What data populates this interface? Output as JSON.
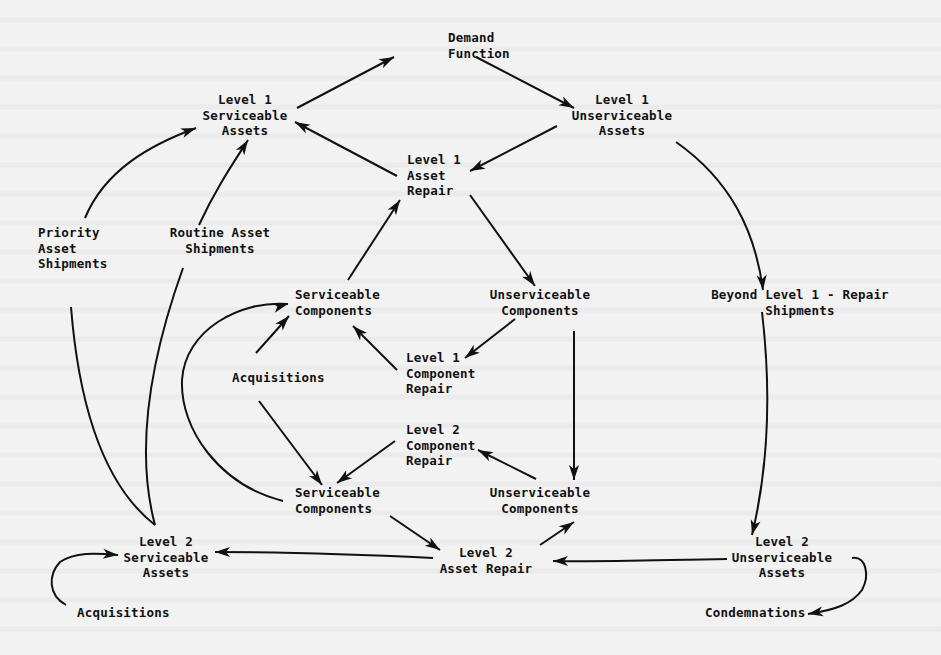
{
  "figure": {
    "type": "flow-diagram"
  },
  "nodes": [
    {
      "id": "demand_function",
      "lines": [
        "Demand",
        "Function"
      ],
      "x": 448,
      "y": 42,
      "anchor": "start"
    },
    {
      "id": "l1_serviceable_assets",
      "lines": [
        "Level 1",
        "Serviceable",
        "Assets"
      ],
      "x": 245,
      "y": 104,
      "anchor": "middle"
    },
    {
      "id": "l1_unserviceable_assets",
      "lines": [
        "Level 1",
        "Unserviceable",
        "Assets"
      ],
      "x": 622,
      "y": 104,
      "anchor": "middle"
    },
    {
      "id": "l1_asset_repair",
      "lines": [
        "Level 1",
        "Asset",
        "Repair"
      ],
      "x": 407,
      "y": 164,
      "anchor": "start"
    },
    {
      "id": "priority_asset_shipments",
      "lines": [
        "Priority",
        "Asset",
        "Shipments"
      ],
      "x": 38,
      "y": 237,
      "anchor": "start"
    },
    {
      "id": "routine_asset_shipments",
      "lines": [
        "Routine Asset",
        "Shipments"
      ],
      "x": 220,
      "y": 237,
      "anchor": "middle"
    },
    {
      "id": "serviceable_components_top",
      "lines": [
        "Serviceable",
        "Components"
      ],
      "x": 295,
      "y": 299,
      "anchor": "start"
    },
    {
      "id": "unserviceable_components_top",
      "lines": [
        "Unserviceable",
        "Components"
      ],
      "x": 540,
      "y": 299,
      "anchor": "middle"
    },
    {
      "id": "beyond_l1_repair_shipments",
      "lines": [
        "Beyond Level 1 - Repair",
        "Shipments"
      ],
      "x": 800,
      "y": 299,
      "anchor": "middle"
    },
    {
      "id": "acquisitions_mid",
      "lines": [
        "Acquisitions"
      ],
      "x": 232,
      "y": 382,
      "anchor": "start"
    },
    {
      "id": "l1_component_repair",
      "lines": [
        "Level 1",
        "Component",
        "Repair"
      ],
      "x": 406,
      "y": 362,
      "anchor": "start"
    },
    {
      "id": "l2_component_repair",
      "lines": [
        "Level 2",
        "Component",
        "Repair"
      ],
      "x": 406,
      "y": 434,
      "anchor": "start"
    },
    {
      "id": "serviceable_components_bottom",
      "lines": [
        "Serviceable",
        "Components"
      ],
      "x": 295,
      "y": 497,
      "anchor": "start"
    },
    {
      "id": "unserviceable_components_bottom",
      "lines": [
        "Unserviceable",
        "Components"
      ],
      "x": 540,
      "y": 497,
      "anchor": "middle"
    },
    {
      "id": "l2_serviceable_assets",
      "lines": [
        "Level 2",
        "Serviceable",
        "Assets"
      ],
      "x": 166,
      "y": 546,
      "anchor": "middle"
    },
    {
      "id": "l2_asset_repair",
      "lines": [
        "Level 2",
        "Asset Repair"
      ],
      "x": 486,
      "y": 557,
      "anchor": "middle"
    },
    {
      "id": "l2_unserviceable_assets",
      "lines": [
        "Level 2",
        "Unserviceable",
        "Assets"
      ],
      "x": 782,
      "y": 546,
      "anchor": "middle"
    },
    {
      "id": "acquisitions_bottom",
      "lines": [
        "Acquisitions"
      ],
      "x": 77,
      "y": 617,
      "anchor": "start"
    },
    {
      "id": "condemnations",
      "lines": [
        "Condemnations"
      ],
      "x": 705,
      "y": 617,
      "anchor": "start"
    }
  ],
  "edges": [
    {
      "from": "l1_serviceable_assets",
      "to": "demand_function",
      "d": "M297,108 L394,57"
    },
    {
      "from": "demand_function",
      "to": "l1_unserviceable_assets",
      "d": "M476,57 L574,108"
    },
    {
      "from": "l1_unserviceable_assets",
      "to": "l1_asset_repair",
      "d": "M557,126 L470,171"
    },
    {
      "from": "l1_asset_repair",
      "to": "l1_serviceable_assets",
      "d": "M397,176 L295,122"
    },
    {
      "from": "l1_asset_repair",
      "to": "unserviceable_components_top",
      "d": "M470,195 L535,286"
    },
    {
      "from": "serviceable_components_top",
      "to": "l1_asset_repair",
      "d": "M348,280 L400,200"
    },
    {
      "from": "priority_asset_shipments",
      "to": "l1_serviceable_assets",
      "d": "M85,218 C105,170 150,145 196,128"
    },
    {
      "from": "routine_asset_shipments",
      "to": "l1_serviceable_assets",
      "d": "M199,225 C215,190 232,165 248,140"
    },
    {
      "from": "l1_unserviceable_assets",
      "to": "beyond_l1_repair_shipments",
      "d": "M676,142 C730,180 755,230 763,290"
    },
    {
      "from": "unserviceable_components_top",
      "to": "l1_component_repair",
      "d": "M515,319 L465,358"
    },
    {
      "from": "l1_component_repair",
      "to": "serviceable_components_top",
      "d": "M397,370 L353,326"
    },
    {
      "from": "acquisitions_mid",
      "to": "serviceable_components_top",
      "d": "M256,353 L289,316"
    },
    {
      "from": "acquisitions_mid",
      "to": "serviceable_components_bottom",
      "d": "M259,401 L322,485"
    },
    {
      "from": "l2_component_repair",
      "to": "serviceable_components_bottom",
      "d": "M395,441 L337,483"
    },
    {
      "from": "unserviceable_components_bottom",
      "to": "l2_component_repair",
      "d": "M536,479 L478,450"
    },
    {
      "from": "unserviceable_components_top",
      "to": "unserviceable_components_bottom",
      "d": "M574,331 L574,480"
    },
    {
      "from": "serviceable_components_bottom",
      "to": "l2_asset_repair",
      "d": "M390,516 L440,550"
    },
    {
      "from": "l2_asset_repair",
      "to": "unserviceable_components_bottom",
      "d": "M540,545 L574,522"
    },
    {
      "from": "l2_unserviceable_assets",
      "to": "l2_asset_repair",
      "d": "M727,559 C660,560 600,562 553,561"
    },
    {
      "from": "l2_asset_repair",
      "to": "l2_serviceable_assets",
      "d": "M433,558 C350,554 280,552 215,552"
    },
    {
      "from": "beyond_l1_repair_shipments",
      "to": "l2_unserviceable_assets",
      "d": "M762,312 C770,380 770,460 752,535"
    },
    {
      "from": "l2_unserviceable_assets",
      "to": "condemnations",
      "d": "M852,558 C866,556 870,575 862,590 C852,604 835,610 808,614"
    },
    {
      "from": "acquisitions_bottom",
      "to": "l2_serviceable_assets",
      "d": "M66,605 C48,595 48,575 60,562 C75,552 95,553 118,555"
    },
    {
      "from": "l2_serviceable_assets",
      "to": "priority_asset_shipments",
      "d": "M155,525 C110,490 80,420 71,307"
    },
    {
      "from": "l2_serviceable_assets",
      "to": "routine_asset_shipments",
      "d": "M155,525 C135,450 150,360 183,268"
    },
    {
      "from": "serviceable_components_bottom",
      "to": "serviceable_components_top",
      "d": "M283,501 C220,485 180,430 182,380 C185,330 240,300 288,304"
    }
  ],
  "arrowheads": [
    {
      "at": "demand_function",
      "x": 394,
      "y": 57,
      "angle": -27
    },
    {
      "at": "l1_unserviceable_assets",
      "x": 574,
      "y": 108,
      "angle": 28
    },
    {
      "at": "l1_asset_repair",
      "x": 470,
      "y": 171,
      "angle": 153
    },
    {
      "at": "l1_serviceable_assets_from_repair",
      "x": 295,
      "y": 122,
      "angle": -152
    },
    {
      "at": "unserviceable_components_top",
      "x": 535,
      "y": 286,
      "angle": 54
    },
    {
      "at": "l1_asset_repair_from_components",
      "x": 400,
      "y": 200,
      "angle": -57
    },
    {
      "at": "l1_serviceable_assets_from_priority",
      "x": 196,
      "y": 128,
      "angle": -20
    },
    {
      "at": "l1_serviceable_assets_from_routine",
      "x": 248,
      "y": 140,
      "angle": -58
    },
    {
      "at": "beyond_l1_repair_shipments",
      "x": 763,
      "y": 290,
      "angle": 85
    },
    {
      "at": "l1_component_repair",
      "x": 465,
      "y": 358,
      "angle": 142
    },
    {
      "at": "serviceable_components_top_from_l1cr",
      "x": 353,
      "y": 326,
      "angle": -135
    },
    {
      "at": "serviceable_components_top_from_acq",
      "x": 289,
      "y": 316,
      "angle": -48
    },
    {
      "at": "serviceable_components_bottom_from_acq",
      "x": 322,
      "y": 485,
      "angle": 53
    },
    {
      "at": "serviceable_components_bottom_from_l2cr",
      "x": 337,
      "y": 483,
      "angle": 144
    },
    {
      "at": "l2_component_repair",
      "x": 478,
      "y": 450,
      "angle": -153
    },
    {
      "at": "unserviceable_components_bottom",
      "x": 574,
      "y": 480,
      "angle": 90
    },
    {
      "at": "l2_asset_repair_from_sc",
      "x": 440,
      "y": 550,
      "angle": 34
    },
    {
      "at": "unserviceable_components_bottom_from_l2ar",
      "x": 574,
      "y": 522,
      "angle": -34
    },
    {
      "at": "l2_asset_repair_from_l2ua",
      "x": 553,
      "y": 561,
      "angle": 180
    },
    {
      "at": "l2_serviceable_assets_from_l2ar",
      "x": 215,
      "y": 552,
      "angle": 180
    },
    {
      "at": "l2_unserviceable_assets",
      "x": 752,
      "y": 535,
      "angle": 104
    },
    {
      "at": "condemnations",
      "x": 808,
      "y": 614,
      "angle": 170
    },
    {
      "at": "l2_serviceable_assets_from_acq",
      "x": 118,
      "y": 555,
      "angle": 5
    },
    {
      "at": "serviceable_components_top_from_loop",
      "x": 288,
      "y": 304,
      "angle": -15
    }
  ],
  "colors": {
    "ink": "#111111",
    "paper": "#f2f2f2"
  }
}
